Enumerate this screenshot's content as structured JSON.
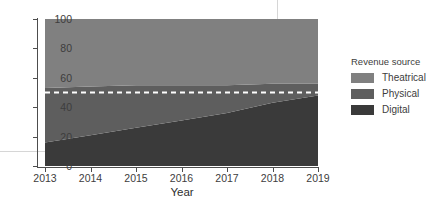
{
  "chart_data": {
    "type": "area",
    "stacked": true,
    "normalized_percent": true,
    "title": "",
    "subtitle": "",
    "xlabel": "Year",
    "ylabel": "",
    "x": [
      2013,
      2014,
      2015,
      2016,
      2017,
      2018,
      2019
    ],
    "xlim": [
      2013,
      2019
    ],
    "ylim": [
      0,
      100
    ],
    "xticks": [
      "2013",
      "2014",
      "2015",
      "2016",
      "2017",
      "2018",
      "2019"
    ],
    "yticks": [
      "0",
      "20",
      "40",
      "60",
      "80",
      "100"
    ],
    "ytick_values": [
      0,
      20,
      40,
      60,
      80,
      100
    ],
    "grid": false,
    "legend_position": "right",
    "legend_title": "Revenue source",
    "series": [
      {
        "name": "Theatrical",
        "color": "#808080",
        "stack_order": 3,
        "values": [
          47,
          46,
          45,
          45,
          45,
          44,
          44
        ]
      },
      {
        "name": "Physical",
        "color": "#5e5e5e",
        "stack_order": 2,
        "values": [
          37,
          33,
          29,
          24,
          19,
          13,
          8
        ]
      },
      {
        "name": "Digital",
        "color": "#3a3a3a",
        "stack_order": 1,
        "values": [
          16,
          21,
          26,
          31,
          36,
          43,
          48
        ]
      }
    ],
    "cumulative_digital_top": [
      16,
      21,
      26,
      31,
      36,
      43,
      48
    ],
    "cumulative_physical_top": [
      53,
      54,
      55,
      55,
      55,
      56,
      56
    ],
    "annotations": [
      {
        "type": "hline",
        "name": "fifty-percent-reference-line",
        "value": 50,
        "style": "dashed",
        "color": "#ffffff"
      }
    ]
  },
  "axes": {
    "y_ticks": [
      {
        "label": "100",
        "value": 100
      },
      {
        "label": "80",
        "value": 80
      },
      {
        "label": "60",
        "value": 60
      },
      {
        "label": "40",
        "value": 40
      },
      {
        "label": "20",
        "value": 20
      },
      {
        "label": "0",
        "value": 0
      }
    ],
    "x_ticks": [
      {
        "label": "2013",
        "value": 2013
      },
      {
        "label": "2014",
        "value": 2014
      },
      {
        "label": "2015",
        "value": 2015
      },
      {
        "label": "2016",
        "value": 2016
      },
      {
        "label": "2017",
        "value": 2017
      },
      {
        "label": "2018",
        "value": 2018
      },
      {
        "label": "2019",
        "value": 2019
      }
    ],
    "x_title": "Year"
  },
  "legend": {
    "title": "Revenue source",
    "items": [
      {
        "label": "Theatrical",
        "color": "#808080"
      },
      {
        "label": "Physical",
        "color": "#5e5e5e"
      },
      {
        "label": "Digital",
        "color": "#3a3a3a"
      }
    ]
  },
  "colors": {
    "theatrical": "#808080",
    "physical": "#5e5e5e",
    "digital": "#3a3a3a",
    "reference_line": "#ffffff",
    "axis": "#4d4d4d",
    "text": "#3d3d3d",
    "background": "#ffffff"
  }
}
